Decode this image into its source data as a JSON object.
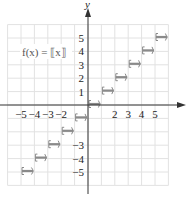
{
  "chart_data": {
    "type": "line",
    "title": "",
    "function_label": "f(x) = ⟦x⟧",
    "xlabel": "x",
    "ylabel": "y",
    "xlim": [
      -6,
      6
    ],
    "ylim": [
      -6,
      6
    ],
    "grid": true,
    "x_tick_labels": [
      {
        "value": -5,
        "label": "−5"
      },
      {
        "value": -4,
        "label": "−4"
      },
      {
        "value": -3,
        "label": "−3"
      },
      {
        "value": -2,
        "label": "−2"
      },
      {
        "value": 2,
        "label": "2"
      },
      {
        "value": 3,
        "label": "3"
      },
      {
        "value": 4,
        "label": "4"
      },
      {
        "value": 5,
        "label": "5"
      }
    ],
    "y_tick_labels": [
      {
        "value": 5,
        "label": "5"
      },
      {
        "value": 4,
        "label": "4"
      },
      {
        "value": 3,
        "label": "3"
      },
      {
        "value": 2,
        "label": "2"
      },
      {
        "value": 1,
        "label": "1"
      },
      {
        "value": -3,
        "label": "−3"
      },
      {
        "value": -4,
        "label": "−4"
      },
      {
        "value": -5,
        "label": "−5"
      }
    ],
    "series": [
      {
        "name": "greatest integer function",
        "segments": [
          {
            "x_start": -5,
            "x_end": -4,
            "y": -5,
            "left": "closed",
            "right": "open"
          },
          {
            "x_start": -4,
            "x_end": -3,
            "y": -4,
            "left": "closed",
            "right": "open"
          },
          {
            "x_start": -3,
            "x_end": -2,
            "y": -3,
            "left": "closed",
            "right": "open"
          },
          {
            "x_start": -2,
            "x_end": -1,
            "y": -2,
            "left": "closed",
            "right": "open"
          },
          {
            "x_start": -1,
            "x_end": 0,
            "y": -1,
            "left": "closed",
            "right": "open"
          },
          {
            "x_start": 0,
            "x_end": 1,
            "y": 0,
            "left": "closed",
            "right": "open"
          },
          {
            "x_start": 1,
            "x_end": 2,
            "y": 1,
            "left": "closed",
            "right": "open"
          },
          {
            "x_start": 2,
            "x_end": 3,
            "y": 2,
            "left": "closed",
            "right": "open"
          },
          {
            "x_start": 3,
            "x_end": 4,
            "y": 3,
            "left": "closed",
            "right": "open"
          },
          {
            "x_start": 4,
            "x_end": 5,
            "y": 4,
            "left": "closed",
            "right": "open"
          },
          {
            "x_start": 5,
            "x_end": 6,
            "y": 5,
            "left": "closed",
            "right": "open"
          }
        ]
      }
    ]
  },
  "colors": {
    "grid": "#e2e2e2",
    "axis": "#333333",
    "step": "#8a8a8a",
    "text": "#222222"
  }
}
